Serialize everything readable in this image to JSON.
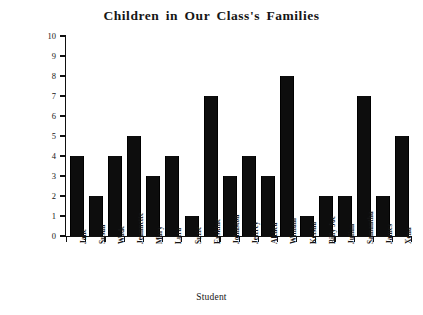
{
  "chart_data": {
    "type": "bar",
    "title": "Children in Our Class's Families",
    "xlabel": "Student",
    "ylabel": "Number of Children in Family",
    "categories": [
      "Jane",
      "Susan",
      "Wade",
      "Jeannette",
      "Mary",
      "Lura",
      "Suzie",
      "Erskine",
      "Johnston",
      "Jeffrey",
      "Althea",
      "William",
      "Keisha",
      "Billy Joe",
      "Julian",
      "Samantha",
      "James",
      "Xena"
    ],
    "values": [
      4,
      2,
      4,
      5,
      3,
      4,
      1,
      7,
      3,
      4,
      3,
      8,
      1,
      2,
      2,
      7,
      2,
      5
    ],
    "ylim": [
      0,
      10
    ],
    "yticks": [
      0,
      1,
      2,
      3,
      4,
      5,
      6,
      7,
      8,
      9,
      10
    ],
    "grid": false,
    "legend": null,
    "bar_color": "#0d0d0d",
    "axis_color": "#111111"
  }
}
